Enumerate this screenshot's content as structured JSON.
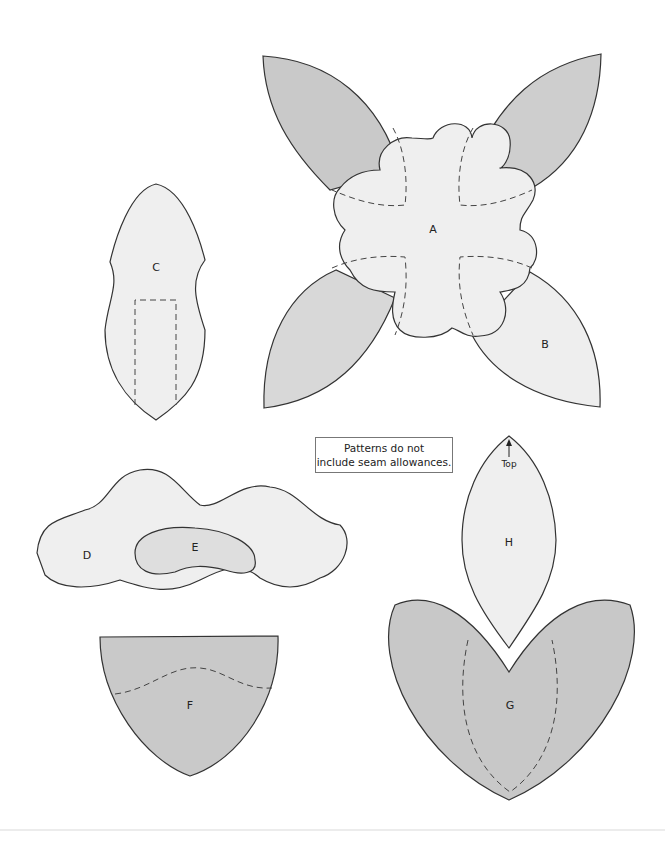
{
  "diagram": {
    "note": {
      "line1": "Patterns do not",
      "line2": "include seam allowances."
    },
    "pieces": [
      {
        "id": "A",
        "label": "A",
        "shape": "scalloped flower center"
      },
      {
        "id": "B",
        "label": "B",
        "shape": "leaf petal (x4)"
      },
      {
        "id": "C",
        "label": "C",
        "shape": "bud with dashed rectangle placement"
      },
      {
        "id": "D",
        "label": "D",
        "shape": "cloud/wavy blob"
      },
      {
        "id": "E",
        "label": "E",
        "shape": "kidney shape inside D"
      },
      {
        "id": "F",
        "label": "F",
        "shape": "shield/cup with dashed wavy line"
      },
      {
        "id": "G",
        "label": "G",
        "shape": "heart-like calyx with dashed inner leaf"
      },
      {
        "id": "H",
        "label": "H",
        "shape": "pointed oval petal"
      }
    ],
    "arrow_label": "Top",
    "colors": {
      "light_fill": "#eeeeee",
      "dark_fill": "#c8c8c8",
      "outline": "#333333",
      "dash": "#444444"
    }
  }
}
